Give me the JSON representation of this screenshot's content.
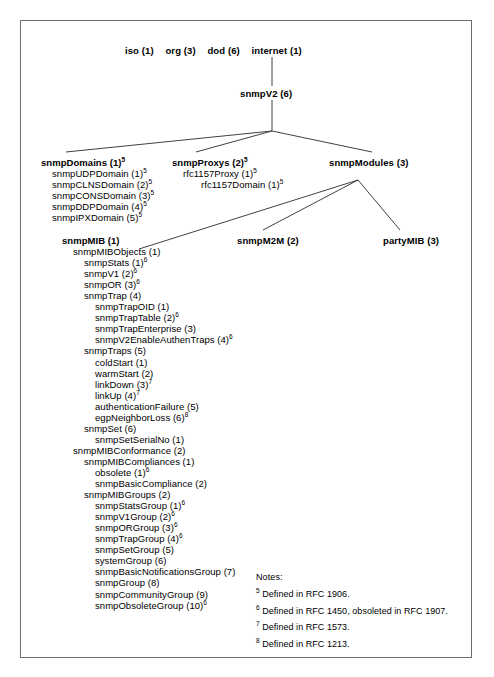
{
  "diagram": {
    "root_path": [
      {
        "label": "iso (1)"
      },
      {
        "label": "org (3)"
      },
      {
        "label": "dod (6)"
      },
      {
        "label": "internet (1)"
      }
    ],
    "snmpv2": {
      "label": "snmpV2 (6)"
    },
    "branches": {
      "snmp_domains": {
        "label": "snmpDomains (1)",
        "sup": "5",
        "children": [
          {
            "label": "snmpUDPDomain (1)",
            "sup": "5"
          },
          {
            "label": "snmpCLNSDomain (2)",
            "sup": "5"
          },
          {
            "label": "snmpCONSDomain (3)",
            "sup": "5"
          },
          {
            "label": "snmpDDPDomain (4)",
            "sup": "5"
          },
          {
            "label": "snmpIPXDomain (5)",
            "sup": "5"
          }
        ]
      },
      "snmp_proxys": {
        "label": "snmpProxys (2)",
        "sup": "5",
        "children": [
          {
            "label": "rfc1157Proxy (1)",
            "sup": "5",
            "indent": 1
          },
          {
            "label": "rfc1157Domain (1)",
            "sup": "5",
            "indent": 2
          }
        ]
      },
      "snmp_modules": {
        "label": "snmpModules (3)",
        "sup": ""
      },
      "snmp_m2m": {
        "label": "snmpM2M (2)",
        "sup": ""
      },
      "party_mib": {
        "label": "partyMIB (3)",
        "sup": ""
      }
    },
    "snmp_mib": {
      "label": "snmpMIB (1)",
      "sup": "",
      "nodes": [
        {
          "label": "snmpMIBObjects (1)",
          "sup": "",
          "indent": 1
        },
        {
          "label": "snmpStats (1)",
          "sup": "6",
          "indent": 2
        },
        {
          "label": "snmpV1 (2)",
          "sup": "6",
          "indent": 2
        },
        {
          "label": "snmpOR (3)",
          "sup": "6",
          "indent": 2
        },
        {
          "label": "snmpTrap (4)",
          "sup": "",
          "indent": 2
        },
        {
          "label": "snmpTrapOID (1)",
          "sup": "",
          "indent": 3
        },
        {
          "label": "snmpTrapTable (2)",
          "sup": "6",
          "indent": 3
        },
        {
          "label": "snmpTrapEnterprise (3)",
          "sup": "",
          "indent": 3
        },
        {
          "label": "snmpV2EnableAuthenTraps (4)",
          "sup": "6",
          "indent": 3
        },
        {
          "label": "snmpTraps (5)",
          "sup": "",
          "indent": 2
        },
        {
          "label": "coldStart (1)",
          "sup": "",
          "indent": 3
        },
        {
          "label": "warmStart (2)",
          "sup": "",
          "indent": 3
        },
        {
          "label": "linkDown (3)",
          "sup": "7",
          "indent": 3
        },
        {
          "label": "linkUp (4)",
          "sup": "7",
          "indent": 3
        },
        {
          "label": "authenticationFailure (5)",
          "sup": "",
          "indent": 3
        },
        {
          "label": "egpNeighborLoss (6)",
          "sup": "8",
          "indent": 3
        },
        {
          "label": "snmpSet (6)",
          "sup": "",
          "indent": 2
        },
        {
          "label": "snmpSetSerialNo (1)",
          "sup": "",
          "indent": 3
        },
        {
          "label": "snmpMIBConformance (2)",
          "sup": "",
          "indent": 1
        },
        {
          "label": "snmpMIBCompliances (1)",
          "sup": "",
          "indent": 2
        },
        {
          "label": "obsolete (1)",
          "sup": "6",
          "indent": 3
        },
        {
          "label": "snmpBasicCompliance (2)",
          "sup": "",
          "indent": 3
        },
        {
          "label": "snmpMIBGroups (2)",
          "sup": "",
          "indent": 2
        },
        {
          "label": "snmpStatsGroup (1)",
          "sup": "6",
          "indent": 3
        },
        {
          "label": "snmpV1Group (2)",
          "sup": "6",
          "indent": 3
        },
        {
          "label": "snmpORGroup (3)",
          "sup": "6",
          "indent": 3
        },
        {
          "label": "snmpTrapGroup (4)",
          "sup": "6",
          "indent": 3
        },
        {
          "label": "snmpSetGroup (5)",
          "sup": "",
          "indent": 3
        },
        {
          "label": "systemGroup (6)",
          "sup": "",
          "indent": 3
        },
        {
          "label": "snmpBasicNotificationsGroup (7)",
          "sup": "",
          "indent": 3
        },
        {
          "label": "snmpGroup (8)",
          "sup": "",
          "indent": 3
        },
        {
          "label": "snmpCommunityGroup (9)",
          "sup": "",
          "indent": 3
        },
        {
          "label": "snmpObsoleteGroup (10)",
          "sup": "6",
          "indent": 3
        }
      ]
    },
    "notes": {
      "title": "Notes:",
      "items": [
        {
          "marker": "5",
          "text": "Defined in RFC 1906."
        },
        {
          "marker": "6",
          "text": "Defined in RFC 1450, obsoleted in RFC 1907."
        },
        {
          "marker": "7",
          "text": "Defined in RFC 1573."
        },
        {
          "marker": "8",
          "text": "Defined in RFC 1213."
        }
      ]
    },
    "colors": {
      "line": "#404040",
      "border": "#6e6e6e",
      "text": "#000000",
      "background": "#ffffff"
    }
  }
}
